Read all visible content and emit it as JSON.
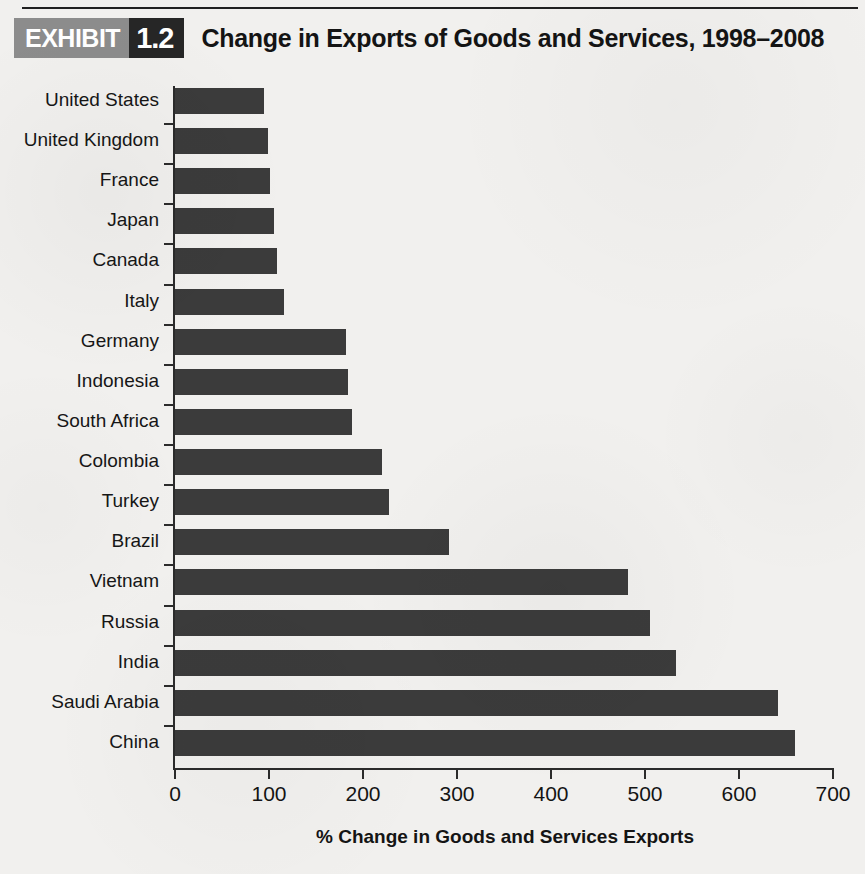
{
  "exhibit": {
    "badge_word": "EXHIBIT",
    "badge_number": "1.2",
    "title": "Change in Exports of Goods and Services, 1998–2008"
  },
  "colors": {
    "bar": "#3b3b3b",
    "axis": "#2b2b2b",
    "background": "#f1f0ee",
    "badge_word_bg": "#8c8c8c",
    "badge_number_bg": "#262626",
    "text": "#141414"
  },
  "chart_data": {
    "type": "bar",
    "orientation": "horizontal",
    "title": "Change in Exports of Goods and Services, 1998–2008",
    "xlabel": "% Change in Goods and Services Exports",
    "ylabel": "",
    "xlim": [
      0,
      700
    ],
    "xticks": [
      0,
      100,
      200,
      300,
      400,
      500,
      600,
      700
    ],
    "grid": false,
    "legend": false,
    "categories": [
      "United States",
      "United Kingdom",
      "France",
      "Japan",
      "Canada",
      "Italy",
      "Germany",
      "Indonesia",
      "South Africa",
      "Colombia",
      "Turkey",
      "Brazil",
      "Vietnam",
      "Russia",
      "India",
      "Saudi Arabia",
      "China"
    ],
    "values": [
      95,
      99,
      101,
      105,
      108,
      116,
      182,
      184,
      188,
      220,
      228,
      292,
      482,
      505,
      533,
      641,
      660
    ]
  }
}
